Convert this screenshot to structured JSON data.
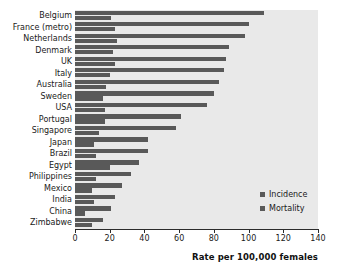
{
  "chart_data": {
    "type": "bar",
    "orientation": "horizontal",
    "title": "",
    "xlabel": "Rate per 100,000 females",
    "ylabel": "",
    "xlim": [
      0,
      140
    ],
    "xticks": [
      0,
      20,
      40,
      60,
      80,
      100,
      120,
      140
    ],
    "grid": false,
    "legend_position": "inside lower-right",
    "categories": [
      "Belgium",
      "France (metro)",
      "Netherlands",
      "Denmark",
      "UK",
      "Italy",
      "Australia",
      "Sweden",
      "USA",
      "Portugal",
      "Singapore",
      "Japan",
      "Brazil",
      "Egypt",
      "Philippines",
      "Mexico",
      "India",
      "China",
      "Zimbabwe"
    ],
    "series": [
      {
        "name": "Incidence",
        "color": "#595959",
        "values": [
          109,
          100,
          98,
          89,
          87,
          86,
          83,
          80,
          76,
          61,
          58,
          42,
          42,
          37,
          32,
          27,
          23,
          21,
          16
        ]
      },
      {
        "name": "Mortality",
        "color": "#595959",
        "values": [
          21,
          23,
          24,
          22,
          23,
          20,
          18,
          16,
          17,
          17,
          14,
          11,
          12,
          20,
          12,
          10,
          11,
          6,
          10
        ]
      }
    ]
  },
  "legend": {
    "items": [
      {
        "label": "Incidence"
      },
      {
        "label": "Mortality"
      }
    ]
  },
  "axis": {
    "x_title": "Rate per 100,000 females",
    "tick_labels": [
      "0",
      "20",
      "40",
      "60",
      "80",
      "100",
      "120",
      "140"
    ]
  },
  "colors": {
    "bar": "#595959",
    "plot_background": "#e9e9e9",
    "axis": "#2b2b2b",
    "text": "#1a1a1a"
  }
}
